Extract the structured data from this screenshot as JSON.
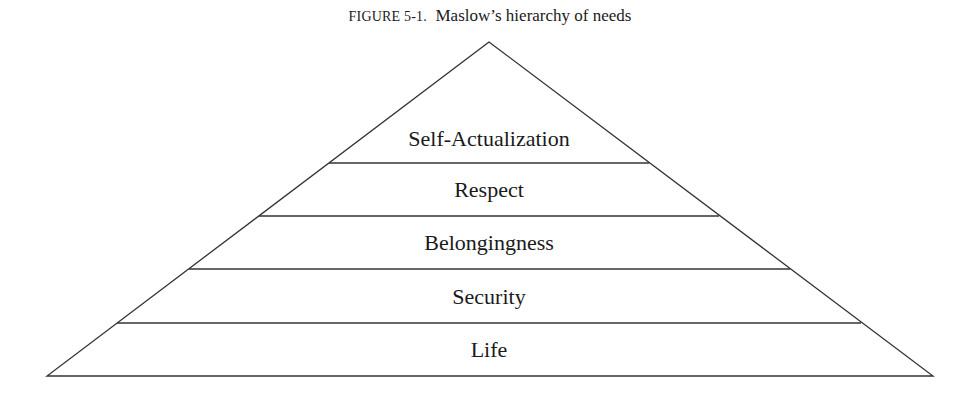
{
  "caption": {
    "label": "FIGURE 5-1.",
    "title": "Maslow’s hierarchy of needs"
  },
  "diagram": {
    "type": "pyramid",
    "apex": [
      489,
      42
    ],
    "base_y": 376,
    "base_left_x": 47,
    "base_right_x": 933,
    "line_color": "#333333",
    "tiers": [
      {
        "label": "Self-Actualization",
        "top_y": 42,
        "bottom_y": 163
      },
      {
        "label": "Respect",
        "top_y": 163,
        "bottom_y": 216
      },
      {
        "label": "Belongingness",
        "top_y": 216,
        "bottom_y": 269
      },
      {
        "label": "Security",
        "top_y": 269,
        "bottom_y": 323
      },
      {
        "label": "Life",
        "top_y": 323,
        "bottom_y": 376
      }
    ]
  }
}
